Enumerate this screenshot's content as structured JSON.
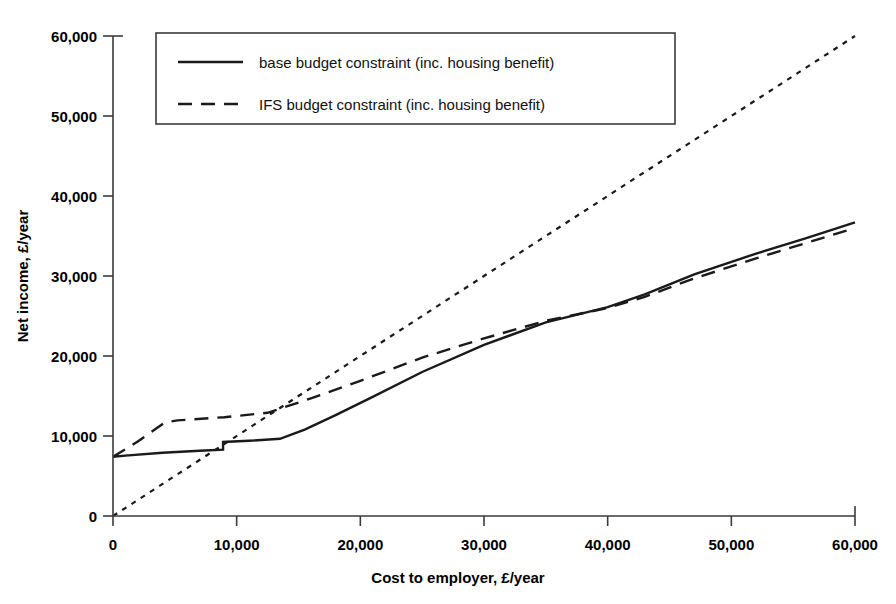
{
  "chart_data": {
    "type": "line",
    "title": "",
    "xlabel": "Cost to employer, £/year",
    "ylabel": "Net income, £/year",
    "xlim": [
      0,
      60000
    ],
    "ylim": [
      0,
      60000
    ],
    "grid": false,
    "legend_position": "top-left-inside",
    "x_ticks": [
      "0",
      "10,000",
      "20,000",
      "30,000",
      "40,000",
      "50,000",
      "60,000"
    ],
    "x_tick_values": [
      0,
      10000,
      20000,
      30000,
      40000,
      50000,
      60000
    ],
    "y_ticks": [
      "0",
      "10,000",
      "20,000",
      "30,000",
      "40,000",
      "50,000",
      "60,000"
    ],
    "y_tick_values": [
      0,
      10000,
      20000,
      30000,
      40000,
      50000,
      60000
    ],
    "series": [
      {
        "name": "base budget constraint (inc. housing benefit)",
        "style": "solid",
        "points": [
          [
            0,
            7400
          ],
          [
            1000,
            7550
          ],
          [
            4000,
            7900
          ],
          [
            7000,
            8150
          ],
          [
            8900,
            8300
          ],
          [
            8900,
            9250
          ],
          [
            11000,
            9400
          ],
          [
            13500,
            9650
          ],
          [
            15500,
            10800
          ],
          [
            18000,
            12600
          ],
          [
            21000,
            14900
          ],
          [
            25000,
            18000
          ],
          [
            30000,
            21400
          ],
          [
            35000,
            24200
          ],
          [
            40000,
            26100
          ],
          [
            43000,
            27700
          ],
          [
            47000,
            30200
          ],
          [
            52000,
            32800
          ],
          [
            56000,
            34700
          ],
          [
            60000,
            36700
          ]
        ]
      },
      {
        "name": "IFS budget constraint (inc. housing benefit)",
        "style": "dashed",
        "points": [
          [
            0,
            7400
          ],
          [
            2000,
            9300
          ],
          [
            4200,
            11700
          ],
          [
            5200,
            11950
          ],
          [
            9000,
            12350
          ],
          [
            12500,
            12900
          ],
          [
            16000,
            14700
          ],
          [
            20000,
            16900
          ],
          [
            25000,
            19800
          ],
          [
            30000,
            22200
          ],
          [
            35000,
            24400
          ],
          [
            40000,
            26000
          ],
          [
            43000,
            27400
          ],
          [
            47000,
            29700
          ],
          [
            52000,
            32200
          ],
          [
            56000,
            34100
          ],
          [
            60000,
            36000
          ]
        ]
      },
      {
        "name": "45-degree reference line",
        "style": "dotted",
        "points": [
          [
            0,
            0
          ],
          [
            60000,
            60000
          ]
        ]
      }
    ]
  },
  "legend": {
    "entries": [
      {
        "label": "base budget constraint (inc. housing benefit)",
        "style": "solid"
      },
      {
        "label": "IFS budget constraint (inc. housing benefit)",
        "style": "dashed"
      }
    ]
  },
  "colors": {
    "line": "#1a1a1a",
    "axis": "#3b3b3b",
    "background": "#ffffff"
  }
}
